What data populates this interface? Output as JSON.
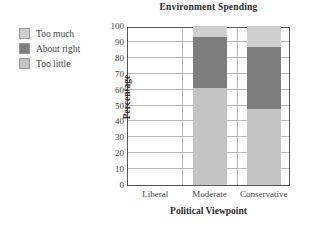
{
  "chart_data": {
    "type": "bar",
    "subtype": "stacked-bar",
    "title": "Environment Spending",
    "xlabel": "Political Viewpoint",
    "ylabel": "Percentage",
    "categories": [
      "Liberal",
      "Moderate",
      "Conservative"
    ],
    "ylim": [
      0,
      100
    ],
    "yticks": [
      0,
      10,
      20,
      30,
      40,
      50,
      60,
      70,
      80,
      90,
      100
    ],
    "grid": true,
    "legend_position": "outside-upper-left",
    "series": [
      {
        "name": "Too little",
        "color": "#c4c4c4",
        "values": [
          null,
          61,
          48
        ]
      },
      {
        "name": "About right",
        "color": "#7d7d7d",
        "values": [
          null,
          32,
          38.5
        ]
      },
      {
        "name": "Too much",
        "color": "#cfcfcf",
        "values": [
          null,
          7,
          13.5
        ]
      }
    ],
    "stack_order_bottom_to_top": [
      "Too little",
      "About right",
      "Too much"
    ]
  },
  "legend": {
    "items": [
      {
        "label": "Too much",
        "color": "#cfcfcf"
      },
      {
        "label": "About right",
        "color": "#7d7d7d"
      },
      {
        "label": "Too little",
        "color": "#c4c4c4"
      }
    ]
  }
}
